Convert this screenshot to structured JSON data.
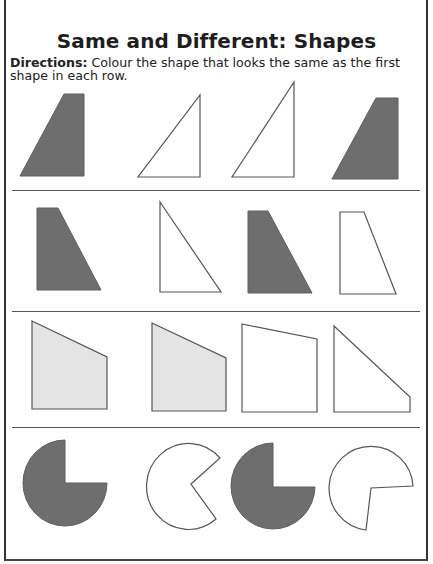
{
  "worksheet": {
    "title": "Same and Different: Shapes",
    "directions_label": "Directions:",
    "directions_text": " Colour the shape that looks the same as the first shape in each row."
  },
  "colors": {
    "dark_fill": "#6e6e6e",
    "light_fill": "#e4e4e4",
    "outline": "#555555",
    "no_fill": "#ffffff"
  },
  "rows": [
    {
      "name": "row-1-right-trapezoid",
      "shapes": [
        {
          "name": "reference-trapezoid",
          "fill": "dark"
        },
        {
          "name": "option-right-triangle",
          "fill": "none"
        },
        {
          "name": "option-tall-right-triangle",
          "fill": "none"
        },
        {
          "name": "option-trapezoid-match",
          "fill": "dark"
        }
      ]
    },
    {
      "name": "row-2-left-trapezoid",
      "shapes": [
        {
          "name": "reference-trapezoid",
          "fill": "dark"
        },
        {
          "name": "option-right-triangle",
          "fill": "none"
        },
        {
          "name": "option-trapezoid-match",
          "fill": "dark"
        },
        {
          "name": "option-narrow-trapezoid",
          "fill": "none"
        }
      ]
    },
    {
      "name": "row-3-pentagon-slant",
      "shapes": [
        {
          "name": "reference-quadrilateral",
          "fill": "light"
        },
        {
          "name": "option-quadrilateral-match",
          "fill": "light"
        },
        {
          "name": "option-near-square",
          "fill": "none"
        },
        {
          "name": "option-right-trapezoid",
          "fill": "none"
        }
      ]
    },
    {
      "name": "row-4-pie-quarter-cut",
      "shapes": [
        {
          "name": "reference-pie",
          "fill": "dark"
        },
        {
          "name": "option-pacman",
          "fill": "none"
        },
        {
          "name": "option-pie-match",
          "fill": "dark"
        },
        {
          "name": "option-rotated-pie",
          "fill": "none"
        }
      ]
    }
  ]
}
